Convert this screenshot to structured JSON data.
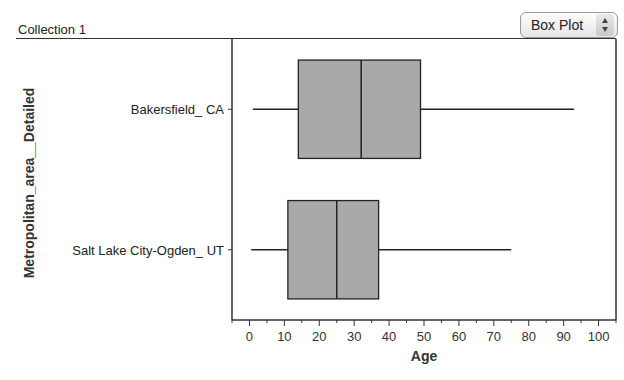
{
  "header": {
    "collection_title": "Collection 1",
    "plot_type_selected": "Box Plot"
  },
  "chart_data": {
    "type": "boxplot",
    "orientation": "horizontal",
    "title": "",
    "xlabel": "Age",
    "ylabel": "Metropolitan_area__Detailed",
    "xlim": [
      -5,
      105
    ],
    "x_ticks": [
      0,
      10,
      20,
      30,
      40,
      50,
      60,
      70,
      80,
      90,
      100
    ],
    "x_minor_ticks": [
      5,
      15,
      25,
      35,
      45,
      55,
      65,
      75,
      85,
      95
    ],
    "categories": [
      "Bakersfield_ CA",
      "Salt Lake City-Ogden_ UT"
    ],
    "series": [
      {
        "name": "Bakersfield_ CA",
        "min": 1,
        "q1": 14,
        "median": 32,
        "q3": 49,
        "max": 93
      },
      {
        "name": "Salt Lake City-Ogden_ UT",
        "min": 0.5,
        "q1": 11,
        "median": 25,
        "q3": 37,
        "max": 75
      }
    ],
    "box_fill": "#a9a9a9",
    "line_color": "#222222",
    "grid": false,
    "legend": "none"
  }
}
